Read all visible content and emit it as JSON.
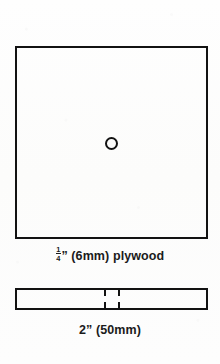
{
  "diagram": {
    "line_color": "#121212",
    "background_color": "#fdfdfc",
    "plan_view": {
      "shape_name": "square-plywood-panel",
      "hole_name": "center-hole"
    },
    "edge_view": {
      "shape_name": "plywood-edge-profile",
      "kerf_marks": 2
    }
  },
  "captions": {
    "plywood": {
      "fraction_numerator": "1",
      "fraction_denominator": "4",
      "inch_mark": "”",
      "metric": "(6mm)",
      "material": "plywood",
      "full_text": "¼” (6mm) plywood"
    },
    "thickness": {
      "full_text": "2” (50mm)"
    }
  }
}
